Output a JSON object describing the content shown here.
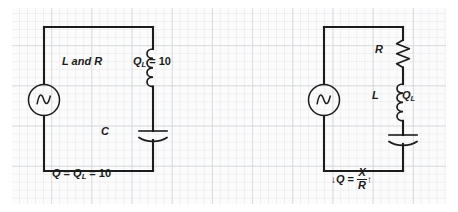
{
  "figure": {
    "type": "electrical-circuit-diagram",
    "background": "graph-paper-grid",
    "grid_color": "#c9cdd2",
    "line_color": "#1c1c1c",
    "canvas": {
      "width": 458,
      "height": 212
    }
  },
  "left_circuit": {
    "name": "series-resonant-circuit-coil-with-internal-resistance",
    "source": {
      "type": "ac-source",
      "symbol": "sine-wave-in-circle"
    },
    "inductor": {
      "symbol": "coil",
      "label_left": "L and R",
      "label_right_q": "Q",
      "label_right_sub": "L",
      "label_right_value": " = 10"
    },
    "capacitor": {
      "symbol": "curved-plate-capacitor",
      "label": "C"
    },
    "caption": {
      "q": "Q",
      "eq1": " = ",
      "ql": "Q",
      "ql_sub": "L",
      "eq2": " = 10"
    }
  },
  "right_circuit": {
    "name": "series-rlc-circuit-separate-resistance",
    "source": {
      "type": "ac-source",
      "symbol": "sine-wave-in-circle"
    },
    "resistor": {
      "symbol": "zigzag-resistor",
      "label": "R"
    },
    "inductor": {
      "symbol": "coil",
      "label_left": "L",
      "label_right_q": "Q",
      "label_right_sub": "L"
    },
    "capacitor": {
      "symbol": "curved-plate-capacitor",
      "label": ""
    },
    "caption": {
      "arrow_left": "↓",
      "q": "Q",
      "eq": " = ",
      "numerator": "X",
      "denominator": "R",
      "arrow_right": "↑"
    }
  }
}
